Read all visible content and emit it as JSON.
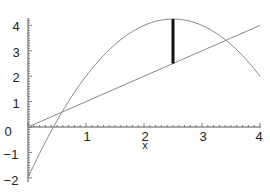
{
  "chart_data": {
    "type": "line",
    "title": "",
    "xlabel": "x",
    "ylabel": "",
    "xlim": [
      0,
      4
    ],
    "ylim": [
      -2,
      4.3
    ],
    "xticks": [
      "1",
      "2",
      "3",
      "4"
    ],
    "yticks": [
      "-2",
      "-1",
      "0",
      "1",
      "2",
      "3",
      "4"
    ],
    "grid": false,
    "series": [
      {
        "name": "f(x) = -x^2 + 5x - 2",
        "x": [
          0,
          0.5,
          1,
          1.5,
          2,
          2.5,
          3,
          3.5,
          4
        ],
        "y": [
          -2,
          0.25,
          2,
          3.25,
          4,
          4.25,
          4,
          3.25,
          2
        ]
      },
      {
        "name": "g(x) = x",
        "x": [
          0,
          4
        ],
        "y": [
          0,
          4
        ]
      }
    ],
    "annotations": [
      {
        "type": "vertical-segment",
        "x": 2.5,
        "y_from": 2.5,
        "y_to": 4.25,
        "style": "bold black"
      }
    ]
  },
  "labels": {
    "x_axis": "x",
    "xtick_1": "1",
    "xtick_2": "2",
    "xtick_3": "3",
    "xtick_4": "4",
    "ytick_n2": "−2",
    "ytick_n1": "−1",
    "ytick_0": "0",
    "ytick_1": "1",
    "ytick_2": "2",
    "ytick_3": "3",
    "ytick_4": "4"
  }
}
